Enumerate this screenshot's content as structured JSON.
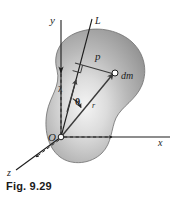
{
  "figure": {
    "caption": "Fig. 9.29",
    "background_color": "#ffffff",
    "ink_color": "#1d1d1d",
    "body_fill_light": "#f0f0f0",
    "body_fill_mid": "#b8b8b8",
    "body_fill_dark": "#8f8f8f",
    "body_outline_color": "#7a7a7a"
  },
  "labels": {
    "y_axis": "y",
    "x_axis": "x",
    "z_axis": "z",
    "line_L": "L",
    "origin": "O",
    "perpendicular_distance": "p",
    "mass_element": "dm",
    "position_vector": "r",
    "angle": "θ",
    "unit_vector": "λ"
  },
  "elements": {
    "body_shape_name": "rigid-body-blob",
    "right_angle_marker": "square",
    "origin_marker": "open-circle",
    "mass_point_marker": "open-circle",
    "y_axis_style": "solid-with-arrow",
    "x_axis_style": "solid-with-arrow",
    "z_axis_style": "dashed-with-arrow",
    "dashed_guides": [
      "y-down-to-origin",
      "x-right-from-origin",
      "z-down-left-from-origin"
    ]
  }
}
